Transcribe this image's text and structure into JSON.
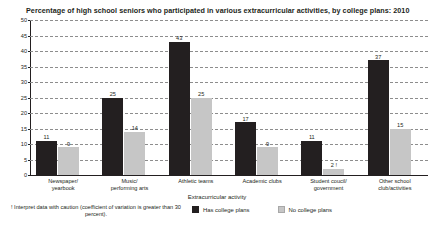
{
  "chart_data": {
    "type": "bar",
    "title": "Percentage of high school seniors who participated in various extracurricular activities, by college plans: 2010",
    "xlabel": "Extracurricular activity",
    "ylabel": "",
    "ylim": [
      0,
      50
    ],
    "ytick_step": 5,
    "yticks": [
      "0",
      "5",
      "10",
      "15",
      "20",
      "25",
      "30",
      "35",
      "40",
      "45",
      "50"
    ],
    "grid": true,
    "grid_style": "dashed-horizontal",
    "legend_position": "bottom-center",
    "categories": [
      "Newspaper/ yearbook",
      "Music/ performing arts",
      "Athletic teams",
      "Academic clubs",
      "Student coucil/ government",
      "Other school club/activities"
    ],
    "category_lines": [
      [
        "Newspaper/",
        "yearbook"
      ],
      [
        "Music/",
        "performing arts"
      ],
      [
        "Athletic teams",
        ""
      ],
      [
        "Academic clubs",
        ""
      ],
      [
        "Student coucil/",
        "government"
      ],
      [
        "Other school",
        "club/activities"
      ]
    ],
    "series": [
      {
        "name": "Has college plans",
        "color": "#231f20",
        "values": [
          11,
          25,
          43,
          17,
          11,
          37
        ],
        "labels": [
          "11",
          "25",
          "43",
          "17",
          "11",
          "37"
        ],
        "flags": [
          "",
          "",
          "",
          "",
          "",
          ""
        ]
      },
      {
        "name": "No college plans",
        "color": "#c6c6c6",
        "values": [
          9,
          14,
          25,
          9,
          2,
          15
        ],
        "labels": [
          "9",
          "14",
          "25",
          "9",
          "2",
          "15"
        ],
        "flags": [
          "",
          "",
          "",
          "",
          "!",
          ""
        ]
      }
    ],
    "footnote": "! Interpret data with caution (coefficient of variation is greater than 30 percent)."
  },
  "legend": {
    "items": [
      {
        "label": "Has college plans",
        "swatch": "dark"
      },
      {
        "label": "No college plans",
        "swatch": "light"
      }
    ]
  }
}
